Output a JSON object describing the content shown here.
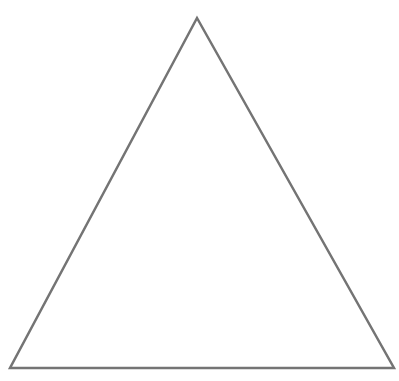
{
  "diagram": {
    "shape": "triangle",
    "kind": "equilateral-outline",
    "vertices": {
      "apex": [
        197,
        18
      ],
      "bottom_left": [
        10,
        368
      ],
      "bottom_right": [
        394,
        368
      ]
    },
    "stroke_color": "#747474",
    "stroke_width": 2.5,
    "fill_color": "#ffffff",
    "background_color": "#ffffff"
  }
}
